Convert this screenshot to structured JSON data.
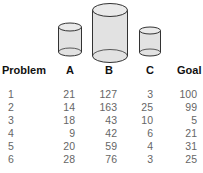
{
  "jars": [
    {
      "label": "A",
      "name": "jar-a"
    },
    {
      "label": "B",
      "name": "jar-b"
    },
    {
      "label": "C",
      "name": "jar-c"
    }
  ],
  "table": {
    "headers": [
      "Problem",
      "A",
      "B",
      "C",
      "Goal"
    ],
    "rows": [
      [
        "1",
        "21",
        "127",
        "3",
        "100"
      ],
      [
        "2",
        "14",
        "163",
        "25",
        "99"
      ],
      [
        "3",
        "18",
        "43",
        "10",
        "5"
      ],
      [
        "4",
        "9",
        "42",
        "6",
        "21"
      ],
      [
        "5",
        "20",
        "59",
        "4",
        "31"
      ],
      [
        "6",
        "28",
        "76",
        "3",
        "25"
      ]
    ]
  },
  "colors": {
    "jar_fill": "#e2e2e2",
    "jar_stroke": "#333333"
  }
}
